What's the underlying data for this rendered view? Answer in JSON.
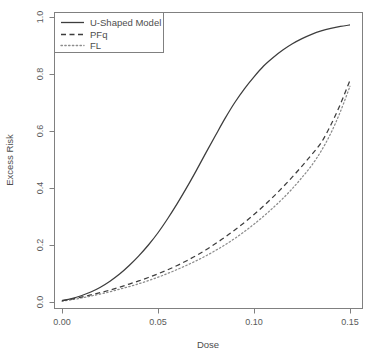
{
  "chart_data": {
    "type": "line",
    "title": "",
    "xlabel": "Dose",
    "ylabel": "Excess Risk",
    "xlim": [
      0.0,
      0.155
    ],
    "ylim": [
      0.0,
      1.0
    ],
    "xticks": [
      "0.00",
      "0.05",
      "0.10",
      "0.15"
    ],
    "xtick_values": [
      0.0,
      0.05,
      0.1,
      0.15
    ],
    "yticks": [
      "0.0",
      "0.2",
      "0.4",
      "0.6",
      "0.8",
      "1.0"
    ],
    "ytick_values": [
      0.0,
      0.2,
      0.4,
      0.6,
      0.8,
      1.0
    ],
    "grid": false,
    "legend_position": "top-left",
    "x": [
      0.0,
      0.005,
      0.01,
      0.015,
      0.02,
      0.025,
      0.03,
      0.035,
      0.04,
      0.045,
      0.05,
      0.055,
      0.06,
      0.065,
      0.07,
      0.075,
      0.08,
      0.085,
      0.09,
      0.095,
      0.1,
      0.105,
      0.11,
      0.115,
      0.12,
      0.125,
      0.13,
      0.135,
      0.14,
      0.145,
      0.15
    ],
    "series": [
      {
        "name": "U-Shaped Model",
        "style": "solid",
        "color": "#3d3d3d",
        "values": [
          0.005,
          0.012,
          0.022,
          0.035,
          0.052,
          0.073,
          0.098,
          0.128,
          0.162,
          0.2,
          0.243,
          0.292,
          0.345,
          0.402,
          0.462,
          0.524,
          0.585,
          0.645,
          0.7,
          0.748,
          0.79,
          0.828,
          0.858,
          0.884,
          0.906,
          0.924,
          0.939,
          0.951,
          0.96,
          0.967,
          0.972
        ]
      },
      {
        "name": "PFq",
        "style": "dashed",
        "color": "#3d3d3d",
        "values": [
          0.004,
          0.01,
          0.017,
          0.025,
          0.033,
          0.042,
          0.052,
          0.063,
          0.074,
          0.086,
          0.099,
          0.113,
          0.128,
          0.145,
          0.163,
          0.183,
          0.205,
          0.228,
          0.253,
          0.279,
          0.307,
          0.337,
          0.369,
          0.403,
          0.439,
          0.477,
          0.517,
          0.559,
          0.621,
          0.694,
          0.778
        ]
      },
      {
        "name": "FL",
        "style": "dotted",
        "color": "#8c8c8c",
        "values": [
          0.003,
          0.008,
          0.014,
          0.021,
          0.028,
          0.036,
          0.045,
          0.054,
          0.064,
          0.075,
          0.087,
          0.1,
          0.114,
          0.129,
          0.145,
          0.162,
          0.181,
          0.201,
          0.223,
          0.247,
          0.273,
          0.301,
          0.331,
          0.363,
          0.398,
          0.437,
          0.479,
          0.53,
          0.592,
          0.668,
          0.757
        ]
      }
    ]
  },
  "legend": {
    "entries": [
      {
        "label": "U-Shaped Model"
      },
      {
        "label": "PFq"
      },
      {
        "label": "FL"
      }
    ]
  },
  "axes": {
    "x_title": "Dose",
    "y_title": "Excess Risk",
    "x_tick_labels": [
      "0.00",
      "0.05",
      "0.10",
      "0.15"
    ],
    "y_tick_labels": [
      "0.0",
      "0.2",
      "0.4",
      "0.6",
      "0.8",
      "1.0"
    ]
  }
}
